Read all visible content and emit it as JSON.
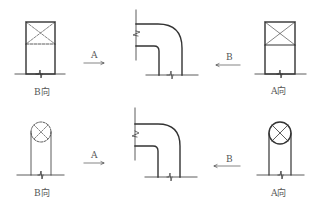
{
  "rows": [
    {
      "type": "rectangular-duct",
      "left_view_label": "B向",
      "right_view_label": "A向",
      "arrow_left_label": "A",
      "arrow_right_label": "B"
    },
    {
      "type": "round-duct",
      "left_view_label": "B向",
      "right_view_label": "A向",
      "arrow_left_label": "A",
      "arrow_right_label": "B"
    }
  ],
  "colors": {
    "stroke": "#333333",
    "text": "#555555"
  }
}
